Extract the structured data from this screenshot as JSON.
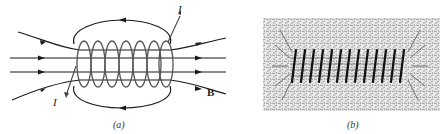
{
  "figure": {
    "panel_a": {
      "caption": "(a)",
      "labels": {
        "current_top": "I",
        "current_bottom": "I",
        "field": "B"
      },
      "turns": 7
    },
    "panel_b": {
      "caption": "(b)",
      "turns": 13
    },
    "colors": {
      "line": "#1a1a1a",
      "coil": "#555555",
      "background": "#ffffff",
      "filings": "#3a3a3a"
    }
  }
}
